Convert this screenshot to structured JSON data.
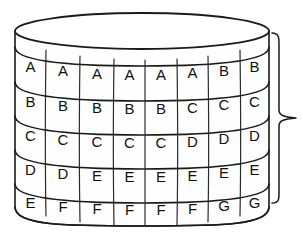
{
  "figure": {
    "background_color": "#ffffff",
    "line_color": "#1a1a1a",
    "text_color": "#111111",
    "surface_color": "#fefefe"
  },
  "cylinder": {
    "name": "lettered-cylinder",
    "columns": 8,
    "rows": 5,
    "top_ellipse": {
      "cx": 142,
      "cy": 31,
      "rx": 127,
      "ry": 18
    },
    "left_edge_x": 15,
    "right_edge_x": 269,
    "body_top_y": 31,
    "body_bottom_y": 207,
    "bottom_bulge": 18
  },
  "grid": {
    "row_labels": [
      [
        "A",
        "A",
        "A",
        "A",
        "A",
        "A",
        "B",
        "B"
      ],
      [
        "B",
        "B",
        "B",
        "B",
        "B",
        "C",
        "C",
        "C"
      ],
      [
        "C",
        "C",
        "C",
        "C",
        "C",
        "D",
        "D",
        "D"
      ],
      [
        "D",
        "D",
        "E",
        "E",
        "E",
        "E",
        "E",
        "E"
      ],
      [
        "E",
        "F",
        "F",
        "F",
        "F",
        "F",
        "G",
        "G"
      ]
    ],
    "column_boundaries": [
      15,
      46,
      80,
      114,
      145,
      177,
      208,
      240,
      269
    ],
    "row_boundaries": [
      47,
      82,
      116,
      150,
      184,
      216
    ]
  },
  "brace": {
    "name": "right-brace",
    "orientation": "right",
    "top_y": 33,
    "bottom_y": 203,
    "tip_y": 118,
    "stem_x": 279,
    "tip_x": 296,
    "hook_x": 272,
    "label": ""
  }
}
